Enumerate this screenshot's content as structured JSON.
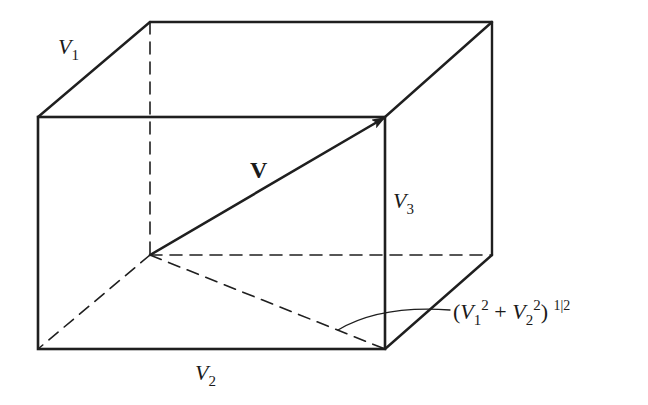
{
  "diagram": {
    "type": "vector-components-box",
    "stroke_color": "#1f1f1f",
    "background": "#ffffff",
    "labels": {
      "v1": {
        "main": "V",
        "sub": "1"
      },
      "v2": {
        "main": "V",
        "sub": "2"
      },
      "v3": {
        "main": "V",
        "sub": "3"
      },
      "vector": "V",
      "magnitude": {
        "open": "(",
        "v1": "V",
        "v1_sub": "1",
        "v1_sup": "2",
        "plus": " + ",
        "v2": "V",
        "v2_sub": "2",
        "v2_sup": "2",
        "close": ")",
        "exponent": "1|2"
      }
    }
  }
}
